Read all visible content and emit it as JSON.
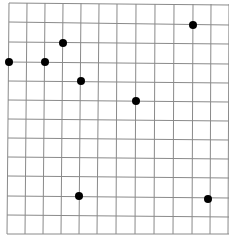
{
  "grid": {
    "line_color": "#8a8a8a",
    "dot_color": "#000000",
    "vertical_lines": [
      {
        "x1": 9,
        "y1": 3,
        "x2": 7,
        "y2": 234
      },
      {
        "x1": 27,
        "y1": 3,
        "x2": 25,
        "y2": 234
      },
      {
        "x1": 45,
        "y1": 3,
        "x2": 43,
        "y2": 234
      },
      {
        "x1": 63,
        "y1": 3,
        "x2": 61,
        "y2": 234
      },
      {
        "x1": 81,
        "y1": 3,
        "x2": 79,
        "y2": 234
      },
      {
        "x1": 99,
        "y1": 4,
        "x2": 97,
        "y2": 234
      },
      {
        "x1": 117,
        "y1": 4,
        "x2": 116,
        "y2": 234
      },
      {
        "x1": 136,
        "y1": 4,
        "x2": 135,
        "y2": 234
      },
      {
        "x1": 155,
        "y1": 4,
        "x2": 154,
        "y2": 234
      },
      {
        "x1": 174,
        "y1": 4,
        "x2": 173,
        "y2": 234
      },
      {
        "x1": 193,
        "y1": 4,
        "x2": 192,
        "y2": 234
      },
      {
        "x1": 211,
        "y1": 4,
        "x2": 210,
        "y2": 234
      },
      {
        "x1": 229,
        "y1": 4,
        "x2": 228,
        "y2": 234
      }
    ],
    "horizontal_lines": [
      {
        "x1": 9,
        "y1": 3,
        "x2": 229,
        "y2": 5
      },
      {
        "x1": 9,
        "y1": 22,
        "x2": 229,
        "y2": 25
      },
      {
        "x1": 9,
        "y1": 42,
        "x2": 229,
        "y2": 44
      },
      {
        "x1": 8,
        "y1": 62,
        "x2": 229,
        "y2": 64
      },
      {
        "x1": 8,
        "y1": 81,
        "x2": 229,
        "y2": 83
      },
      {
        "x1": 8,
        "y1": 100,
        "x2": 229,
        "y2": 102
      },
      {
        "x1": 8,
        "y1": 119,
        "x2": 229,
        "y2": 121
      },
      {
        "x1": 8,
        "y1": 138,
        "x2": 229,
        "y2": 140
      },
      {
        "x1": 8,
        "y1": 157,
        "x2": 229,
        "y2": 159
      },
      {
        "x1": 8,
        "y1": 176,
        "x2": 229,
        "y2": 178
      },
      {
        "x1": 7,
        "y1": 196,
        "x2": 229,
        "y2": 198
      },
      {
        "x1": 7,
        "y1": 215,
        "x2": 229,
        "y2": 217
      },
      {
        "x1": 7,
        "y1": 234,
        "x2": 229,
        "y2": 234
      }
    ],
    "dots": [
      {
        "x": 9,
        "y": 62
      },
      {
        "x": 45,
        "y": 62
      },
      {
        "x": 63,
        "y": 43
      },
      {
        "x": 81,
        "y": 81
      },
      {
        "x": 136,
        "y": 101
      },
      {
        "x": 193,
        "y": 25
      },
      {
        "x": 79,
        "y": 196
      },
      {
        "x": 208,
        "y": 199
      }
    ],
    "dot_radius": 4
  }
}
